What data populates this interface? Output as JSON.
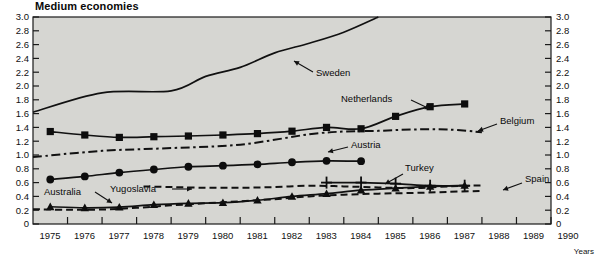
{
  "title": "Medium economies",
  "axis": {
    "x_title": "Years",
    "y_ticks": [
      "0",
      "0.2",
      "0.4",
      "0.6",
      "0.8",
      "1.0",
      "1.2",
      "1.4",
      "1.6",
      "1.8",
      "2.0",
      "2.2",
      "2.4",
      "2.6",
      "2.8",
      "3.0"
    ],
    "x_ticks": [
      "1975",
      "1976",
      "1977",
      "1978",
      "1979",
      "1980",
      "1981",
      "1982",
      "1983",
      "1984",
      "1985",
      "1986",
      "1987",
      "1988",
      "1989",
      "1990"
    ]
  },
  "labels": {
    "sweden": "Sweden",
    "netherlands": "Netherlands",
    "belgium": "Belgium",
    "austria": "Austria",
    "turkey": "Turkey",
    "spain": "Spain",
    "australia": "Australia",
    "yugoslavia": "Yugoslavia"
  },
  "chart_data": {
    "type": "line",
    "title": "Medium economies",
    "xlabel": "Years",
    "ylabel": "",
    "xlim": [
      1975,
      1990
    ],
    "ylim": [
      0,
      3.0
    ],
    "ytick_step": 0.2,
    "grid": false,
    "legend": "inline-annotations",
    "marker_legend": {
      "square": "Netherlands",
      "circle": "Austria",
      "triangle": "Australia",
      "plus": "Turkey",
      "none-solid": "Sweden",
      "dash-dot": "Belgium / Spain",
      "dashed": "Yugoslavia"
    },
    "series": [
      {
        "name": "Sweden",
        "style": "solid",
        "marker": "none",
        "x": [
          1975,
          1977,
          1979,
          1980,
          1981,
          1982,
          1983,
          1984,
          1985
        ],
        "values": [
          1.62,
          1.9,
          1.93,
          2.14,
          2.27,
          2.48,
          2.62,
          2.78,
          3.0
        ]
      },
      {
        "name": "Netherlands",
        "style": "solid",
        "marker": "square",
        "x": [
          1975.5,
          1976.5,
          1977.5,
          1978.5,
          1979.5,
          1980.5,
          1981.5,
          1982.5,
          1983.5,
          1984.5,
          1985.5,
          1986.5,
          1987.5
        ],
        "values": [
          1.34,
          1.29,
          1.255,
          1.265,
          1.275,
          1.29,
          1.31,
          1.345,
          1.4,
          1.38,
          1.56,
          1.7,
          1.74
        ]
      },
      {
        "name": "Belgium",
        "style": "dash-dot",
        "marker": "none",
        "x": [
          1975,
          1977,
          1979,
          1981,
          1983,
          1984,
          1985,
          1986,
          1987,
          1988
        ],
        "values": [
          0.97,
          1.06,
          1.1,
          1.15,
          1.3,
          1.34,
          1.35,
          1.37,
          1.37,
          1.33
        ]
      },
      {
        "name": "Austria",
        "style": "solid",
        "marker": "circle",
        "x": [
          1975.5,
          1976.5,
          1977.5,
          1978.5,
          1979.5,
          1980.5,
          1981.5,
          1982.5,
          1983.5,
          1984.5
        ],
        "values": [
          0.645,
          0.69,
          0.745,
          0.79,
          0.83,
          0.845,
          0.865,
          0.895,
          0.915,
          0.91
        ]
      },
      {
        "name": "Turkey",
        "style": "solid",
        "marker": "plus",
        "x": [
          1983.5,
          1984.5,
          1985.5,
          1986.5,
          1987.5
        ],
        "values": [
          0.6,
          0.6,
          0.585,
          0.555,
          0.555
        ]
      },
      {
        "name": "Yugoslavia",
        "style": "dashed",
        "marker": "none",
        "x": [
          1978.2,
          1979,
          1980,
          1981,
          1982,
          1983,
          1984,
          1985,
          1986,
          1987,
          1988
        ],
        "values": [
          0.545,
          0.535,
          0.525,
          0.525,
          0.535,
          0.555,
          0.545,
          0.53,
          0.52,
          0.545,
          0.56
        ]
      },
      {
        "name": "Australia",
        "style": "solid",
        "marker": "triangle",
        "x": [
          1975.5,
          1976.5,
          1977.5,
          1978.5,
          1979.5,
          1980.5,
          1981.5,
          1982.5,
          1983.5,
          1984.5,
          1985.5,
          1986.5,
          1987.5
        ],
        "values": [
          0.25,
          0.235,
          0.245,
          0.28,
          0.3,
          0.31,
          0.345,
          0.4,
          0.44,
          0.49,
          0.52,
          0.545,
          0.56
        ]
      },
      {
        "name": "Spain",
        "style": "dashed",
        "marker": "none",
        "x": [
          1975,
          1976,
          1977,
          1978,
          1979,
          1980,
          1981,
          1982,
          1983,
          1984,
          1985,
          1986,
          1987,
          1988
        ],
        "values": [
          0.215,
          0.205,
          0.21,
          0.235,
          0.27,
          0.3,
          0.33,
          0.36,
          0.4,
          0.425,
          0.44,
          0.45,
          0.465,
          0.48
        ]
      }
    ]
  },
  "colors": {
    "plot_background": "#d6d6d2",
    "line": "#111111",
    "text": "#111111",
    "page_background": "#ffffff"
  }
}
